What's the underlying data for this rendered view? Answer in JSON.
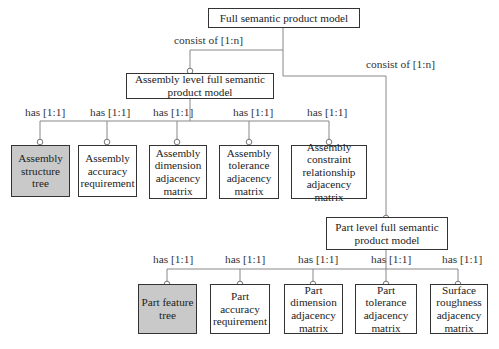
{
  "root": {
    "label": "Full semantic product model"
  },
  "relations": {
    "consist_assembly": "consist of [1:n]",
    "consist_part": "consist of [1:n]"
  },
  "assembly": {
    "label": "Assembly level full semantic product model",
    "relation": "has [1:1]",
    "children": [
      {
        "label": "Assembly structure tree",
        "highlighted": true
      },
      {
        "label": "Assembly accuracy requirement",
        "highlighted": false
      },
      {
        "label": "Assembly dimension adjacency matrix",
        "highlighted": false
      },
      {
        "label": "Assembly tolerance adjacency matrix",
        "highlighted": false
      },
      {
        "label": "Assembly constraint relationship adjacency matrix",
        "highlighted": false
      }
    ]
  },
  "part": {
    "label": "Part level full semantic product model",
    "relation": "has [1:1]",
    "children": [
      {
        "label": "Part feature tree",
        "highlighted": true
      },
      {
        "label": "Part accuracy requirement",
        "highlighted": false
      },
      {
        "label": "Part dimension adjacency matrix",
        "highlighted": false
      },
      {
        "label": "Part tolerance adjacency matrix",
        "highlighted": false
      },
      {
        "label": "Surface roughness adjacency matrix",
        "highlighted": false
      }
    ]
  },
  "colors": {
    "highlight_fill": "#c9c9c9",
    "line": "#888888",
    "border": "#333333"
  }
}
